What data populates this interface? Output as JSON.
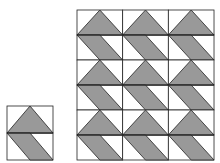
{
  "figure": {
    "fill_color": "#999999",
    "stroke_color": "#222222",
    "background": "#ffffff",
    "single_tile": {
      "x": 7,
      "y": 106,
      "width": 46,
      "height": 54,
      "halves": [
        "triangle-up",
        "parallelogram-down-right"
      ]
    },
    "tessellation": {
      "x": 77,
      "y": 10,
      "cols": 3,
      "rows": 3,
      "tile_width": 45.67,
      "tile_height": 50
    }
  }
}
